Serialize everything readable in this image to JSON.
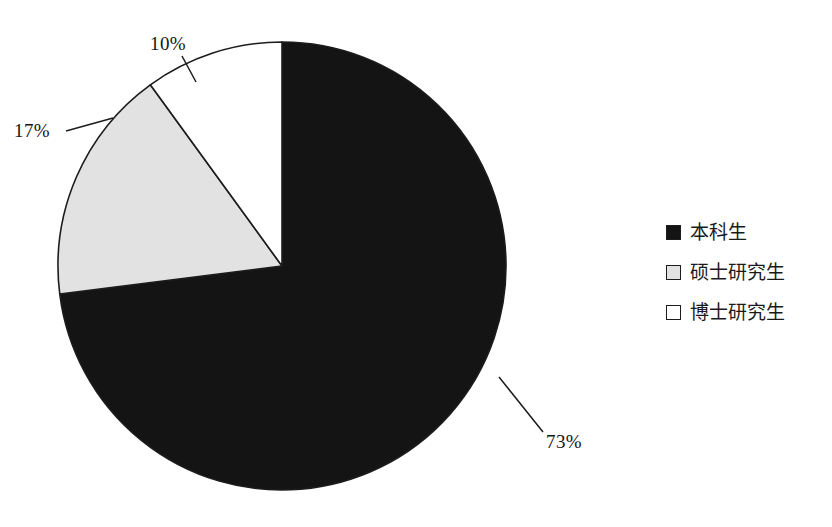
{
  "chart_data": {
    "type": "pie",
    "title": "",
    "categories": [
      "本科生",
      "硕士研究生",
      "博士研究生"
    ],
    "values": [
      73,
      17,
      10
    ],
    "unit": "%",
    "data_labels": [
      "73%",
      "17%",
      "10%"
    ],
    "colors": [
      "#141414",
      "#e2e2e2",
      "#ffffff"
    ],
    "stroke": "#1c1c1c",
    "start_angle_deg": 0,
    "direction": "clockwise",
    "legend_position": "right",
    "legend": [
      {
        "label": "本科生",
        "swatch": "#141414",
        "value": 73,
        "data_label": "73%"
      },
      {
        "label": "硕士研究生",
        "swatch": "#e2e2e2",
        "value": 17,
        "data_label": "17%"
      },
      {
        "label": "博士研究生",
        "swatch": "#ffffff",
        "value": 10,
        "data_label": "10%"
      }
    ],
    "annotations": [
      {
        "text": "10%",
        "x": 150,
        "y": 50,
        "leader_from": [
          182,
          56
        ],
        "leader_to": [
          196,
          82
        ]
      },
      {
        "text": "17%",
        "x": 14,
        "y": 137,
        "leader_from": [
          66,
          131
        ],
        "leader_to": [
          113,
          118
        ]
      },
      {
        "text": "73%",
        "x": 546,
        "y": 448,
        "leader_from": [
          543,
          432
        ],
        "leader_to": [
          499,
          377
        ]
      }
    ],
    "grid": false,
    "xlabel": "",
    "ylabel": ""
  },
  "pie_geometry": {
    "cx": 282,
    "cy": 266,
    "r": 224
  },
  "labels": {
    "slice_73": "73%",
    "slice_17": "17%",
    "slice_10": "10%"
  }
}
